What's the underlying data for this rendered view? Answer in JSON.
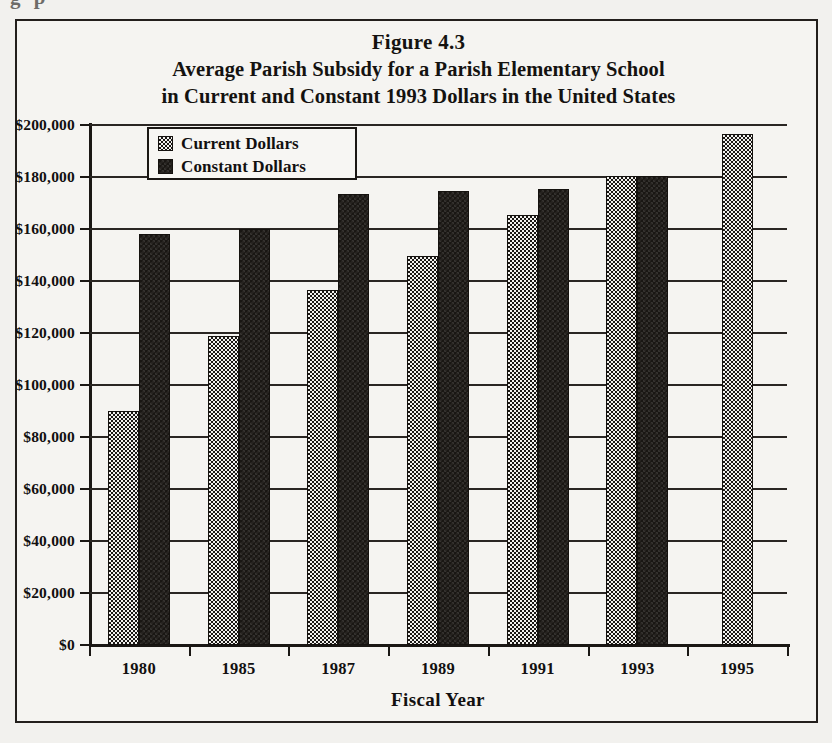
{
  "page": {
    "top_cutoff_text": "g  p"
  },
  "figure": {
    "title_line1": "Figure 4.3",
    "title_line2": "Average Parish Subsidy for a Parish Elementary School",
    "title_line3": "in Current and Constant 1993 Dollars in the United States"
  },
  "legend": {
    "position": "top-left-inside-plot",
    "entries": [
      {
        "label": "Current Dollars",
        "swatch": "checkerboard-pattern-swatch",
        "color": "#1a1714"
      },
      {
        "label": "Constant Dollars",
        "swatch": "solid-black-swatch",
        "color": "#191613"
      }
    ]
  },
  "chart_data": {
    "type": "bar",
    "xlabel": "Fiscal Year",
    "ylabel": "",
    "categories": [
      "1980",
      "1985",
      "1987",
      "1989",
      "1991",
      "1993",
      "1995"
    ],
    "series": [
      {
        "name": "Current Dollars",
        "values": [
          90000,
          119000,
          136500,
          149500,
          165500,
          180500,
          196500
        ]
      },
      {
        "name": "Constant Dollars",
        "values": [
          158000,
          160000,
          173500,
          174500,
          175500,
          180500,
          null
        ]
      }
    ],
    "ylim": [
      0,
      200000
    ],
    "ytick_values": [
      0,
      20000,
      40000,
      60000,
      80000,
      100000,
      120000,
      140000,
      160000,
      180000,
      200000
    ],
    "ytick_labels": [
      "$0",
      "$20,000",
      "$40,000",
      "$60,000",
      "$80,000",
      "$100,000",
      "$120,000",
      "$140,000",
      "$160,000",
      "$180,000",
      "$200,000"
    ],
    "grid": true,
    "legend_position": "upper left"
  }
}
